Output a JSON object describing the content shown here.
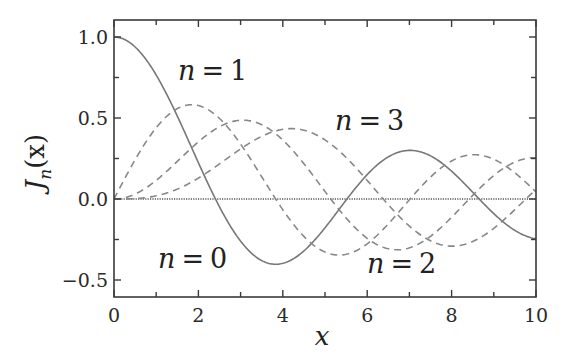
{
  "chart_data": {
    "type": "line",
    "title": "",
    "xlabel": "x",
    "ylabel": "J_n(x)",
    "ylabel_main": "J",
    "ylabel_sub": "n",
    "ylabel_arg": "(x)",
    "xlim": [
      0,
      10
    ],
    "ylim": [
      -0.6,
      1.1
    ],
    "x_ticks": [
      0,
      2,
      4,
      6,
      8,
      10
    ],
    "x_tick_labels": [
      "0",
      "2",
      "4",
      "6",
      "8",
      "10"
    ],
    "x_minor_ticks": [
      1,
      3,
      5,
      7,
      9
    ],
    "y_ticks": [
      -0.5,
      0.0,
      0.5,
      1.0
    ],
    "y_tick_labels": [
      "−0.5",
      "0.0",
      "0.5",
      "1.0"
    ],
    "y_minor_ticks": [
      -0.25,
      0.25,
      0.75
    ],
    "grid": false,
    "legend": "none (inline annotations)",
    "zero_line": {
      "y": 0,
      "style": "dotted"
    },
    "series": [
      {
        "name": "n = 0",
        "order": 0,
        "style": "solid",
        "color": "#777777",
        "x": [
          0,
          1,
          2,
          2.405,
          3,
          3.832,
          4,
          5,
          5.52,
          6,
          7,
          7.016,
          8,
          8.654,
          9,
          10
        ],
        "values": [
          1.0,
          0.765,
          0.224,
          0.0,
          -0.26,
          -0.403,
          -0.397,
          -0.178,
          0.0,
          0.151,
          0.3,
          0.3,
          0.172,
          0.0,
          -0.09,
          -0.246
        ]
      },
      {
        "name": "n = 1",
        "order": 1,
        "style": "dashed",
        "color": "#888888",
        "x": [
          0,
          1,
          1.841,
          2,
          3,
          3.832,
          4,
          5,
          5.331,
          6,
          7,
          7.016,
          8,
          8.536,
          9,
          10
        ],
        "values": [
          0.0,
          0.44,
          0.582,
          0.577,
          0.339,
          0.0,
          -0.066,
          -0.328,
          -0.346,
          -0.277,
          -0.005,
          0.0,
          0.235,
          0.273,
          0.245,
          0.043
        ]
      },
      {
        "name": "n = 2",
        "order": 2,
        "style": "dashed",
        "color": "#888888",
        "x": [
          0,
          1,
          2,
          3,
          3.054,
          4,
          5,
          5.136,
          6,
          6.706,
          7,
          8,
          8.417,
          9,
          10
        ],
        "values": [
          0.0,
          0.115,
          0.353,
          0.486,
          0.487,
          0.364,
          0.047,
          0.0,
          -0.243,
          -0.314,
          -0.301,
          -0.113,
          0.0,
          0.145,
          0.255
        ]
      },
      {
        "name": "n = 3",
        "order": 3,
        "style": "dashed",
        "color": "#888888",
        "x": [
          0,
          1,
          2,
          3,
          4,
          4.201,
          5,
          6,
          6.38,
          7,
          8,
          8.015,
          9,
          9.761,
          10
        ],
        "values": [
          0.0,
          0.02,
          0.129,
          0.309,
          0.43,
          0.434,
          0.365,
          0.115,
          0.0,
          -0.168,
          -0.291,
          -0.291,
          -0.181,
          0.0,
          0.058
        ]
      }
    ],
    "annotations": [
      {
        "text": "n = 1",
        "x": 2.0,
        "y": 0.62
      },
      {
        "text": "n = 3",
        "x": 6.2,
        "y": 0.42
      },
      {
        "text": "n = 0",
        "x": 1.5,
        "y": -0.38
      },
      {
        "text": "n = 2",
        "x": 7.2,
        "y": -0.48
      }
    ]
  },
  "labels": {
    "n1": {
      "var": "n",
      "eq": "=",
      "val": "1"
    },
    "n3": {
      "var": "n",
      "eq": "=",
      "val": "3"
    },
    "n0": {
      "var": "n",
      "eq": "=",
      "val": "0"
    },
    "n2": {
      "var": "n",
      "eq": "=",
      "val": "2"
    }
  }
}
